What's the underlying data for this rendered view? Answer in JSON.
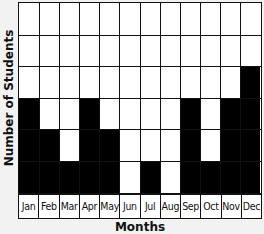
{
  "chart_data": {
    "type": "bar",
    "title": "",
    "xlabel": "Months",
    "ylabel": "Number of Students",
    "categories": [
      "Jan",
      "Feb",
      "Mar",
      "Apr",
      "May",
      "Jun",
      "Jul",
      "Aug",
      "Sep",
      "Oct",
      "Nov",
      "Dec"
    ],
    "values": [
      3,
      2,
      1,
      3,
      2,
      0,
      1,
      0,
      3,
      1,
      3,
      4
    ],
    "ylim": [
      0,
      6
    ],
    "grid": true,
    "legend": null,
    "bar_color": "#000000"
  }
}
